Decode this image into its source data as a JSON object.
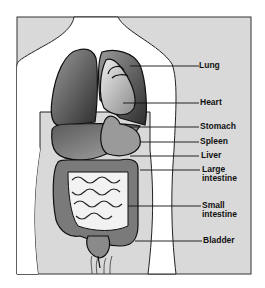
{
  "diagram": {
    "type": "anatomy",
    "labels": [
      {
        "text": "Lung",
        "line_y": 66
      },
      {
        "text": "Heart",
        "line_y": 103
      },
      {
        "text": "Stomach",
        "line_y": 127
      },
      {
        "text": "Spleen",
        "line_y": 142
      },
      {
        "text": "Liver",
        "line_y": 156
      },
      {
        "text": "Large\nintestine",
        "line_y": 170
      },
      {
        "text": "Small\nintestine",
        "line_y": 206
      },
      {
        "text": "Bladder",
        "line_y": 241
      }
    ],
    "colors": {
      "background": "#d9d9d9",
      "body": "#ffffff",
      "outline": "#222222",
      "organ_dark": "#4a4a4a",
      "organ_mid": "#8a8a8a",
      "organ_light": "#c8c8c8"
    }
  }
}
